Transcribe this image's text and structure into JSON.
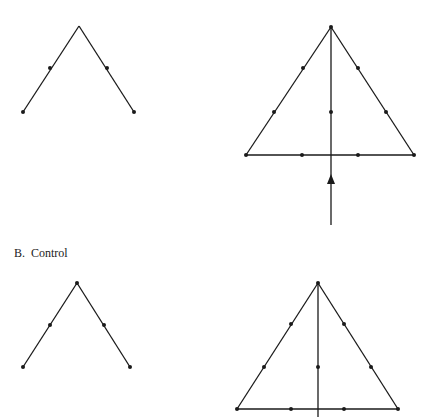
{
  "figure": {
    "panels": [
      {
        "id": "A",
        "label": ""
      },
      {
        "id": "B",
        "label": "B.  Control"
      }
    ],
    "colors": {
      "stroke": "#1a1a1a",
      "background": "#ffffff"
    },
    "shapes": [
      {
        "name": "panel-a-chevron",
        "lines": [
          [
            79,
            26,
            23,
            112
          ],
          [
            79,
            26,
            134,
            112
          ]
        ],
        "dots": [
          [
            23,
            112
          ],
          [
            50,
            68
          ],
          [
            107,
            68
          ],
          [
            134,
            112
          ]
        ]
      },
      {
        "name": "panel-a-triangle",
        "lines": [
          [
            331,
            27,
            246,
            155
          ],
          [
            331,
            27,
            414,
            155
          ],
          [
            246,
            155,
            414,
            155
          ],
          [
            331,
            27,
            331,
            225
          ]
        ],
        "dots": [
          [
            331,
            27
          ],
          [
            303,
            68
          ],
          [
            274,
            112
          ],
          [
            246,
            155
          ],
          [
            358,
            68
          ],
          [
            386,
            112
          ],
          [
            414,
            155
          ],
          [
            331,
            112
          ],
          [
            302,
            155
          ],
          [
            358,
            155
          ]
        ],
        "arrow": {
          "x": 331,
          "tip_y": 174,
          "base_y": 184,
          "half_width": 4,
          "direction": "up"
        }
      },
      {
        "name": "panel-b-chevron",
        "lines": [
          [
            77,
            283,
            23,
            367
          ],
          [
            77,
            283,
            130,
            367
          ]
        ],
        "dots": [
          [
            77,
            283
          ],
          [
            23,
            367
          ],
          [
            50,
            325
          ],
          [
            104,
            325
          ],
          [
            130,
            367
          ]
        ]
      },
      {
        "name": "panel-b-triangle",
        "lines": [
          [
            318,
            283,
            237,
            409
          ],
          [
            318,
            283,
            398,
            409
          ],
          [
            237,
            409,
            398,
            409
          ],
          [
            318,
            283,
            318,
            417
          ]
        ],
        "dots": [
          [
            318,
            283
          ],
          [
            291,
            324
          ],
          [
            264,
            367
          ],
          [
            237,
            409
          ],
          [
            344,
            324
          ],
          [
            371,
            367
          ],
          [
            398,
            409
          ],
          [
            318,
            367
          ],
          [
            291,
            409
          ],
          [
            344,
            409
          ]
        ]
      }
    ]
  }
}
